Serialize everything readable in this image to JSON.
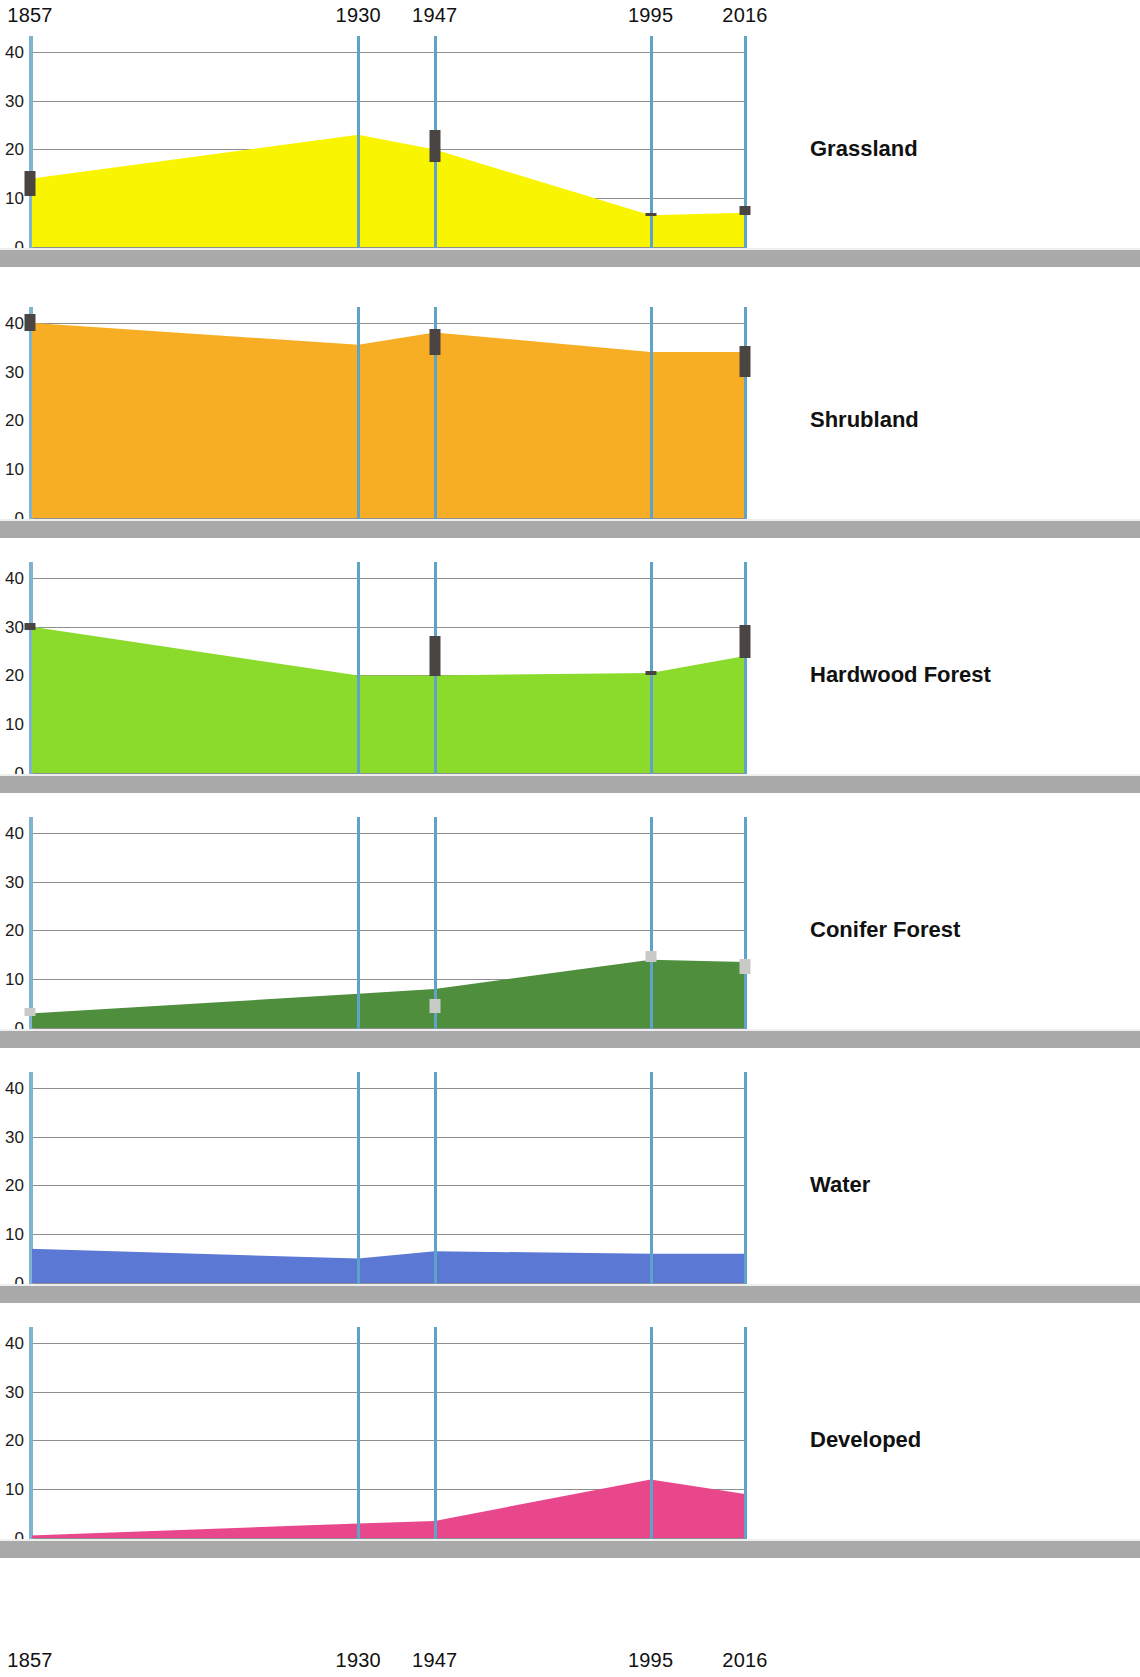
{
  "axis": {
    "year_ticks": [
      1857,
      1930,
      1947,
      1995,
      2016
    ],
    "year_tick_labels": [
      "1857",
      "1930",
      "1947",
      "1995",
      "2016"
    ],
    "y_ticks": [
      0,
      10,
      20,
      30,
      40
    ],
    "y_tick_labels": [
      "0",
      "10",
      "20",
      "30",
      "40"
    ],
    "ylim": [
      0,
      42
    ],
    "xlim": [
      1857,
      2016
    ]
  },
  "chart_data": {
    "type": "area",
    "title": "",
    "subtitle": "",
    "xlabel": "",
    "ylabel": "",
    "xlim": [
      1857,
      2016
    ],
    "ylim": [
      0,
      42
    ],
    "grid": true,
    "legend_position": "right",
    "x": [
      1857,
      1930,
      1947,
      1995,
      2016
    ],
    "x_tick_labels": [
      "1857",
      "1930",
      "1947",
      "1995",
      "2016"
    ],
    "y_ticks": [
      0,
      10,
      20,
      30,
      40
    ],
    "series": [
      {
        "name": "Grassland",
        "color": "#F9F500",
        "values": [
          14,
          23,
          20,
          6.5,
          7
        ],
        "error_bars": [
          {
            "x": 1857,
            "low": 10.5,
            "high": 15.5,
            "shade": "dark"
          },
          {
            "x": 1947,
            "low": 17.5,
            "high": 24.0,
            "shade": "dark"
          },
          {
            "x": 1995,
            "low": 6.3,
            "high": 6.9,
            "shade": "dark"
          },
          {
            "x": 2016,
            "low": 6.6,
            "high": 8.3,
            "shade": "dark"
          }
        ]
      },
      {
        "name": "Shrubland",
        "color": "#F8AE24",
        "values": [
          40,
          35.5,
          38,
          34,
          34
        ],
        "error_bars": [
          {
            "x": 1857,
            "low": 38.3,
            "high": 41.8,
            "shade": "dark"
          },
          {
            "x": 1947,
            "low": 33.3,
            "high": 38.8,
            "shade": "dark"
          },
          {
            "x": 2016,
            "low": 28.8,
            "high": 35.3,
            "shade": "dark"
          }
        ]
      },
      {
        "name": "Hardwood Forest",
        "color": "#8ADB2B",
        "values": [
          30,
          20,
          20,
          20.5,
          24
        ],
        "error_bars": [
          {
            "x": 1857,
            "low": 29.3,
            "high": 30.8,
            "shade": "dark"
          },
          {
            "x": 1947,
            "low": 19.8,
            "high": 28.0,
            "shade": "dark"
          },
          {
            "x": 1995,
            "low": 20.0,
            "high": 21.0,
            "shade": "dark"
          },
          {
            "x": 2016,
            "low": 23.5,
            "high": 30.3,
            "shade": "dark"
          }
        ]
      },
      {
        "name": "Conifer Forest",
        "color": "#4E8E3C",
        "values": [
          3,
          7,
          8,
          14,
          13.5
        ],
        "error_bars": [
          {
            "x": 1857,
            "low": 2.4,
            "high": 4.0,
            "shade": "light"
          },
          {
            "x": 1947,
            "low": 3.0,
            "high": 6.0,
            "shade": "light"
          },
          {
            "x": 1995,
            "low": 13.6,
            "high": 15.7,
            "shade": "light"
          },
          {
            "x": 2016,
            "low": 11.0,
            "high": 14.1,
            "shade": "light"
          }
        ]
      },
      {
        "name": "Water",
        "color": "#5B78D4",
        "values": [
          7,
          5,
          6.5,
          6,
          6
        ],
        "error_bars": []
      },
      {
        "name": "Developed",
        "color": "#E8478C",
        "values": [
          0.5,
          3,
          3.5,
          12,
          9
        ],
        "error_bars": []
      }
    ]
  }
}
